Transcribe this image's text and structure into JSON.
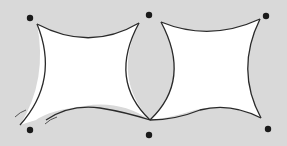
{
  "diagram": {
    "colors": {
      "background": "#d9d9d9",
      "sail_fill": "#ffffff",
      "outline": "#2a2a2a",
      "anchor": "#1a1a1a"
    },
    "anchors": [
      {
        "id": "top-left",
        "x": 30,
        "y": 18
      },
      {
        "id": "top-middle",
        "x": 149,
        "y": 15
      },
      {
        "id": "top-right",
        "x": 266,
        "y": 16
      },
      {
        "id": "bottom-left",
        "x": 30,
        "y": 130
      },
      {
        "id": "bottom-middle",
        "x": 149,
        "y": 135
      },
      {
        "id": "bottom-right",
        "x": 268,
        "y": 129
      }
    ],
    "sails": [
      {
        "id": "left-sail",
        "corners": 4
      },
      {
        "id": "right-sail",
        "corners": 4
      }
    ],
    "motion_marks": 2
  }
}
